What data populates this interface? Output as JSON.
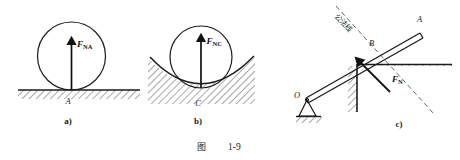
{
  "figure": {
    "caption_cn": "图",
    "caption_number": "1-9",
    "title_full": "图 1-9"
  },
  "panels": [
    {
      "tag": "a)",
      "description": "sphere resting on flat horizontal ground",
      "contact_point_label": "A",
      "force": {
        "symbol": "F",
        "subscript": "NA",
        "full": "F_NA",
        "direction": "up",
        "meaning": "normal-force"
      },
      "surface": "flat-hatched-ground"
    },
    {
      "tag": "b)",
      "description": "sphere resting in concave curved surface",
      "contact_point_label": "C",
      "force": {
        "symbol": "F",
        "subscript": "NC",
        "full": "F_NC",
        "direction": "up",
        "meaning": "normal-force"
      },
      "surface": "concave-hatched-surface"
    },
    {
      "tag": "c)",
      "description": "pinned bar OA contacting a wall corner at B",
      "bar_end_label": "A",
      "contact_point_label": "B",
      "pivot_label": "O",
      "normal_line_cn": "公法线",
      "force": {
        "symbol": "F",
        "subscript": "N",
        "full": "F_N",
        "direction": "up-left along common normal",
        "meaning": "normal-force"
      },
      "surface": "wall-corner-hatched"
    }
  ],
  "colors": {
    "ink": "#1b1b1b",
    "background": "#ffffff",
    "hatch": "#2b2b2b"
  }
}
